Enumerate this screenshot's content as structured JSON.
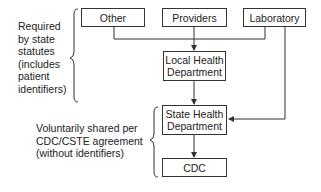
{
  "diagram": {
    "sources": [
      {
        "label": "Other"
      },
      {
        "label": "Providers"
      },
      {
        "label": "Laboratory"
      }
    ],
    "local": {
      "line1": "Local Health",
      "line2": "Department"
    },
    "state": {
      "line1": "State Health",
      "line2": "Department"
    },
    "cdc": {
      "label": "CDC"
    },
    "annotations": {
      "required": [
        "Required",
        "by state",
        "statutes",
        "(includes",
        "patient",
        "identifiers)"
      ],
      "voluntary": [
        "Voluntarily shared per",
        "CDC/CSTE agreement",
        "(without identifiers)"
      ]
    }
  }
}
